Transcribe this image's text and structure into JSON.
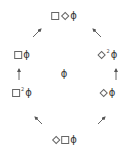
{
  "diagram": {
    "nodes": {
      "top": {
        "tokens": [
          "square",
          "diamond",
          "phi"
        ],
        "phi": "ϕ"
      },
      "upper_left": {
        "tokens": [
          "square",
          "phi"
        ],
        "phi": "ϕ"
      },
      "upper_right": {
        "tokens": [
          "diamond",
          "sup",
          "phi"
        ],
        "sup": "2",
        "phi": "ϕ"
      },
      "center": {
        "phi": "ϕ"
      },
      "lower_left": {
        "tokens": [
          "square",
          "sup",
          "phi"
        ],
        "sup": "2",
        "phi": "ϕ"
      },
      "lower_right": {
        "tokens": [
          "diamond",
          "phi"
        ],
        "phi": "ϕ"
      },
      "bottom": {
        "tokens": [
          "diamond",
          "square",
          "phi"
        ],
        "phi": "ϕ"
      }
    },
    "edges": [
      {
        "from": "upper_left",
        "to": "top",
        "direction": "up-right"
      },
      {
        "from": "upper_right",
        "to": "top",
        "direction": "up-left"
      },
      {
        "from": "lower_left",
        "to": "upper_left",
        "direction": "up"
      },
      {
        "from": "lower_right",
        "to": "upper_right",
        "direction": "up"
      },
      {
        "from": "bottom",
        "to": "lower_left",
        "direction": "up-left"
      },
      {
        "from": "bottom",
        "to": "lower_right",
        "direction": "up-right"
      }
    ],
    "colors": {
      "stroke": "#555555",
      "text": "#333333",
      "background": "#ffffff"
    }
  }
}
